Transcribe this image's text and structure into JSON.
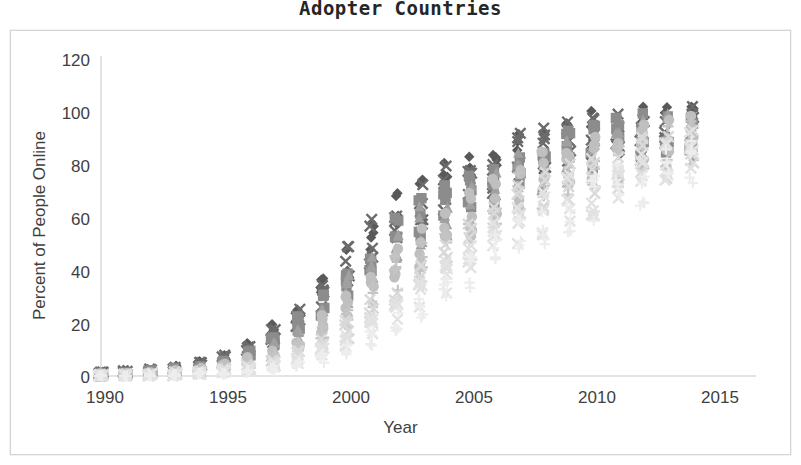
{
  "chart": {
    "title": "Adopter Countries",
    "xlabel": "Year",
    "ylabel": "Percent of People Online"
  },
  "chart_data": {
    "type": "scatter",
    "title": "Adopter Countries",
    "xlabel": "Year",
    "ylabel": "Percent of People Online",
    "xlim": [
      1989,
      2015.5
    ],
    "ylim": [
      0,
      120
    ],
    "xticks": [
      1990,
      1995,
      2000,
      2005,
      2010,
      2015
    ],
    "yticks": [
      0,
      20,
      40,
      60,
      80,
      100,
      120
    ],
    "grid": false,
    "legend": "none",
    "x": [
      1990,
      1991,
      1992,
      1993,
      1994,
      1995,
      1996,
      1997,
      1998,
      1999,
      2000,
      2001,
      2002,
      2003,
      2004,
      2005,
      2006,
      2007,
      2008,
      2009,
      2010,
      2011,
      2012,
      2013,
      2014
    ],
    "marker_colors": {
      "dark_diamond": "#595959",
      "dark_x": "#6b6b6b",
      "mid_square": "#8c8c8c",
      "mid_triangle": "#a0a0a0",
      "light_plus": "#c4c4c4",
      "light_x": "#d9d9d9",
      "pale_circle": "#bfbfbf"
    },
    "series": [
      {
        "name": "series-1",
        "marker": "diamond",
        "color": "#595959",
        "values": [
          1.0,
          1.4,
          2.0,
          3.0,
          4.5,
          7.0,
          11.0,
          16.5,
          22.5,
          32.0,
          43.0,
          52.0,
          60.0,
          66.0,
          72.0,
          76.0,
          80.0,
          83.0,
          85.5,
          88.0,
          90.0,
          91.5,
          93.0,
          94.0,
          95.0
        ]
      },
      {
        "name": "series-2",
        "marker": "x",
        "color": "#6b6b6b",
        "values": [
          0.8,
          1.2,
          1.8,
          2.6,
          4.0,
          6.4,
          10.0,
          15.0,
          21.0,
          30.5,
          41.0,
          50.5,
          58.5,
          64.5,
          70.0,
          74.0,
          78.0,
          81.5,
          84.0,
          87.0,
          89.0,
          90.5,
          92.0,
          93.5,
          94.5
        ]
      },
      {
        "name": "series-3",
        "marker": "square",
        "color": "#8c8c8c",
        "values": [
          0.6,
          0.9,
          1.4,
          2.2,
          3.4,
          5.5,
          8.5,
          13.0,
          19.0,
          27.5,
          37.0,
          46.0,
          54.0,
          60.0,
          66.0,
          70.0,
          74.5,
          78.0,
          81.0,
          84.0,
          86.0,
          88.0,
          90.0,
          91.5,
          92.5
        ]
      },
      {
        "name": "series-4",
        "marker": "triangle",
        "color": "#a0a0a0",
        "values": [
          0.4,
          0.7,
          1.1,
          1.8,
          2.8,
          4.5,
          7.0,
          11.0,
          16.0,
          23.5,
          32.0,
          41.0,
          49.0,
          55.0,
          61.0,
          66.0,
          71.0,
          75.0,
          78.0,
          81.0,
          83.5,
          85.5,
          88.0,
          89.5,
          91.0
        ]
      },
      {
        "name": "series-5",
        "marker": "circle",
        "color": "#bfbfbf",
        "values": [
          0.3,
          0.5,
          0.9,
          1.4,
          2.2,
          3.6,
          5.5,
          8.5,
          13.0,
          19.0,
          27.0,
          36.0,
          44.0,
          50.0,
          57.0,
          62.0,
          67.0,
          71.5,
          75.0,
          78.0,
          80.5,
          83.0,
          86.0,
          88.0,
          89.5
        ]
      },
      {
        "name": "series-6",
        "marker": "plus",
        "color": "#c4c4c4",
        "values": [
          0.2,
          0.4,
          0.7,
          1.1,
          1.7,
          2.8,
          4.3,
          6.8,
          10.5,
          15.5,
          22.0,
          30.0,
          38.0,
          45.0,
          51.0,
          57.0,
          62.5,
          67.0,
          71.0,
          74.5,
          77.5,
          80.0,
          83.0,
          85.5,
          87.5
        ]
      },
      {
        "name": "series-7",
        "marker": "x-light",
        "color": "#d9d9d9",
        "values": [
          0.15,
          0.3,
          0.5,
          0.8,
          1.3,
          2.0,
          3.2,
          5.0,
          8.0,
          12.0,
          17.5,
          24.0,
          31.0,
          38.0,
          45.0,
          51.0,
          57.0,
          62.0,
          67.0,
          71.0,
          74.0,
          77.0,
          80.0,
          83.0,
          85.0
        ]
      },
      {
        "name": "series-8",
        "marker": "x-pale",
        "color": "#e2e2e2",
        "values": [
          0.1,
          0.2,
          0.35,
          0.6,
          0.9,
          1.5,
          2.4,
          3.8,
          6.0,
          9.0,
          13.5,
          19.0,
          25.0,
          31.0,
          38.0,
          44.0,
          50.0,
          56.0,
          61.0,
          66.0,
          69.5,
          73.0,
          76.5,
          80.0,
          82.0
        ]
      },
      {
        "name": "series-9",
        "marker": "plus-pale",
        "color": "#ededed",
        "values": [
          0.05,
          0.12,
          0.22,
          0.4,
          0.65,
          1.0,
          1.7,
          2.7,
          4.3,
          6.6,
          10.0,
          14.5,
          20.0,
          26.0,
          32.0,
          38.5,
          45.0,
          51.0,
          56.5,
          61.5,
          65.5,
          69.5,
          73.0,
          77.0,
          79.5
        ]
      }
    ]
  }
}
